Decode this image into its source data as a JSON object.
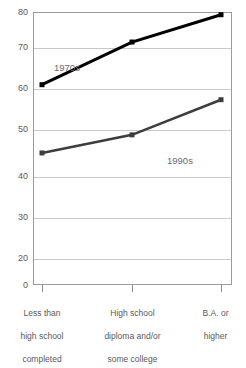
{
  "chart_data": {
    "type": "line",
    "title": "",
    "xlabel": "",
    "ylabel": "",
    "ylim": [
      0,
      80
    ],
    "grid": true,
    "legend_position": "inline-annotation",
    "categories": [
      "Less than\nhigh school\ncompleted",
      "High school\ndiploma and/or\nsome college",
      "B.A. or\nhigher"
    ],
    "ytick_labels": [
      "0",
      "20",
      "30",
      "40",
      "50",
      "60",
      "70",
      "80"
    ],
    "ytick_values": [
      0,
      20,
      30,
      40,
      50,
      60,
      70,
      80
    ],
    "series": [
      {
        "name": "1970s",
        "color": "#000000",
        "marker": "square",
        "line_width": 3,
        "values": [
          58.7,
          71.2,
          79.2
        ]
      },
      {
        "name": "1990s",
        "color": "#3d3d3d",
        "marker": "square",
        "line_width": 2.6,
        "values": [
          38.7,
          44.0,
          54.3
        ]
      }
    ],
    "annotations": [
      {
        "text": "1970s",
        "series": "1970s"
      },
      {
        "text": "1990s",
        "series": "1990s"
      }
    ]
  },
  "axes": {
    "y": {
      "ticks": [
        {
          "label": "80",
          "value": 80
        },
        {
          "label": "70",
          "value": 70
        },
        {
          "label": "60",
          "value": 60
        },
        {
          "label": "50",
          "value": 50
        },
        {
          "label": "40",
          "value": 40
        },
        {
          "label": "30",
          "value": 30
        },
        {
          "label": "20",
          "value": 20
        },
        {
          "label": "0",
          "value": 0
        }
      ]
    },
    "x": {
      "ticks": [
        {
          "line1": "Less than",
          "line2": "high school",
          "line3": "completed"
        },
        {
          "line1": "High school",
          "line2": "diploma and/or",
          "line3": "some college"
        },
        {
          "line1": "B.A. or",
          "line2": "higher",
          "line3": ""
        }
      ]
    }
  },
  "title_fragment": "",
  "colors": {
    "series_1970s": "#000000",
    "series_1990s": "#3d3d3d",
    "gridline": "#c9c9c9",
    "frame": "#9b9b9b",
    "text": "#5a5a5a",
    "background": "#ffffff"
  }
}
